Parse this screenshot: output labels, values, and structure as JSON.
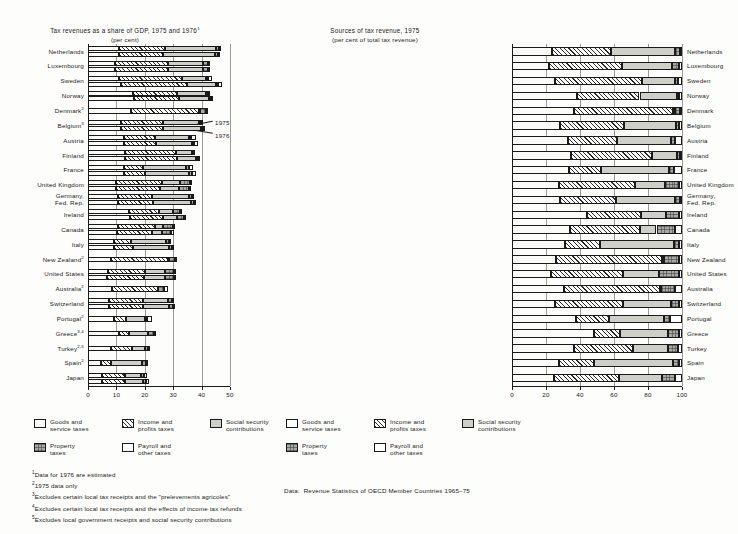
{
  "left": {
    "title": "Tax revenues as a share of GDP, 1975 and 1976",
    "title_sup": "1",
    "subtitle": "(per cent)",
    "annotation_1975": "1975",
    "annotation_1976": "1976"
  },
  "right": {
    "title": "Sources of tax revenue, 1975",
    "subtitle": "(per cent of total tax revenue)"
  },
  "legend": {
    "items": [
      {
        "key": "goods",
        "line1": "Goods and",
        "line2": "service taxes"
      },
      {
        "key": "income",
        "line1": "Income and",
        "line2": "profits taxes"
      },
      {
        "key": "social",
        "line1": "Social security",
        "line2": "contributions"
      },
      {
        "key": "property",
        "line1": "Property",
        "line2": "taxes"
      },
      {
        "key": "payroll",
        "line1": "Payroll and",
        "line2": "other taxes"
      }
    ]
  },
  "footnotes": [
    {
      "mark": "1",
      "text": "Data for 1976 are estimated"
    },
    {
      "mark": "2",
      "text": "1975 data only"
    },
    {
      "mark": "3",
      "text": "Excludes certain local tax receipts and the \"prelevements agricoles\""
    },
    {
      "mark": "4",
      "text": "Excludes certain local tax receipts and the effects of income tax refunds"
    },
    {
      "mark": "5",
      "text": "Excludes local government receipts and social security contributions"
    }
  ],
  "source": {
    "label": "Data:",
    "text": "Revenue Statistics of OECD Member Countries 1965–75"
  },
  "chart_data": [
    {
      "type": "bar",
      "id": "tax-share-of-gdp",
      "orientation": "horizontal",
      "stacked": true,
      "title": "Tax revenues as a share of GDP, 1975 and 1976",
      "subtitle": "(per cent)",
      "xlabel": "",
      "ylabel": "",
      "xlim": [
        0,
        50
      ],
      "xticks": [
        0,
        10,
        20,
        30,
        40,
        50
      ],
      "grid": true,
      "legend_position": "bottom",
      "series": [
        {
          "name": "Goods and service taxes",
          "key": "goods"
        },
        {
          "name": "Income and profits taxes",
          "key": "income"
        },
        {
          "name": "Social security contributions",
          "key": "social"
        },
        {
          "name": "Property taxes",
          "key": "property"
        },
        {
          "name": "Payroll and other taxes",
          "key": "payroll"
        }
      ],
      "categories": [
        "Netherlands",
        "Luxembourg",
        "Sweden",
        "Norway",
        "Denmark",
        "Belgium",
        "Austria",
        "Finland",
        "France",
        "United Kingdom",
        "Germany, Fed. Rep.",
        "Ireland",
        "Canada",
        "Italy",
        "New Zealand",
        "United States",
        "Australia",
        "Switzerland",
        "Portugal",
        "Greece",
        "Turkey",
        "Spain",
        "Japan"
      ],
      "rows": [
        {
          "country": "Netherlands",
          "footnote": "",
          "y1975": {
            "goods": 11.0,
            "income": 16.0,
            "social": 18.0,
            "property": 1.2,
            "payroll": 0.6
          },
          "y1976": {
            "goods": 11.0,
            "income": 15.5,
            "social": 18.2,
            "property": 1.2,
            "payroll": 0.6
          }
        },
        {
          "country": "Luxembourg",
          "footnote": "",
          "y1975": {
            "goods": 9.5,
            "income": 18.5,
            "social": 12.5,
            "property": 1.8,
            "payroll": 0.5
          },
          "y1976": {
            "goods": 9.5,
            "income": 18.5,
            "social": 12.5,
            "property": 1.8,
            "payroll": 0.5
          }
        },
        {
          "country": "Sweden",
          "footnote": "",
          "y1975": {
            "goods": 11.0,
            "income": 22.0,
            "social": 8.5,
            "property": 0.6,
            "payroll": 1.4
          },
          "y1976": {
            "goods": 11.5,
            "income": 23.5,
            "social": 10.0,
            "property": 0.6,
            "payroll": 1.6
          }
        },
        {
          "country": "Norway",
          "footnote": "",
          "y1975": {
            "goods": 16.0,
            "income": 15.5,
            "social": 10.0,
            "property": 0.6,
            "payroll": 0.5
          },
          "y1976": {
            "goods": 16.2,
            "income": 16.0,
            "social": 10.5,
            "property": 0.6,
            "payroll": 0.5
          }
        },
        {
          "country": "Denmark",
          "footnote": "2",
          "y1975": {
            "goods": 15.0,
            "income": 24.0,
            "social": 0.6,
            "property": 1.9,
            "payroll": 0.5
          }
        },
        {
          "country": "Belgium",
          "footnote": "3",
          "y1975": {
            "goods": 11.5,
            "income": 15.0,
            "social": 12.5,
            "property": 0.8,
            "payroll": 0.5
          },
          "y1976": {
            "goods": 11.5,
            "income": 15.0,
            "social": 13.2,
            "property": 0.8,
            "payroll": 0.5
          }
        },
        {
          "country": "Austria",
          "footnote": "",
          "y1975": {
            "goods": 12.5,
            "income": 11.0,
            "social": 12.0,
            "property": 0.8,
            "payroll": 1.6
          },
          "y1976": {
            "goods": 12.5,
            "income": 11.5,
            "social": 12.5,
            "property": 0.8,
            "payroll": 1.6
          }
        },
        {
          "country": "Finland",
          "footnote": "",
          "y1975": {
            "goods": 13.0,
            "income": 18.0,
            "social": 5.5,
            "property": 0.6,
            "payroll": 0.6
          },
          "y1976": {
            "goods": 13.0,
            "income": 18.5,
            "social": 6.5,
            "property": 0.6,
            "payroll": 0.6
          }
        },
        {
          "country": "France",
          "footnote": "",
          "y1975": {
            "goods": 12.5,
            "income": 7.0,
            "social": 15.0,
            "property": 1.0,
            "payroll": 1.6
          },
          "y1976": {
            "goods": 12.5,
            "income": 7.5,
            "social": 15.5,
            "property": 1.0,
            "payroll": 1.6
          }
        },
        {
          "country": "United Kingdom",
          "footnote": "",
          "y1975": {
            "goods": 10.0,
            "income": 16.0,
            "social": 6.5,
            "property": 3.5,
            "payroll": 0.6
          },
          "y1976": {
            "goods": 10.0,
            "income": 15.5,
            "social": 6.5,
            "property": 3.5,
            "payroll": 0.6
          }
        },
        {
          "country": "Germany, Fed. Rep.",
          "footnote": "",
          "y1975": {
            "goods": 10.5,
            "income": 12.0,
            "social": 13.0,
            "property": 1.2,
            "payroll": 0.5
          },
          "y1976": {
            "goods": 10.5,
            "income": 12.5,
            "social": 13.2,
            "property": 1.2,
            "payroll": 0.5
          }
        },
        {
          "country": "Ireland",
          "footnote": "",
          "y1975": {
            "goods": 14.5,
            "income": 10.5,
            "social": 5.0,
            "property": 2.3,
            "payroll": 0.6
          },
          "y1976": {
            "goods": 14.8,
            "income": 11.5,
            "social": 5.2,
            "property": 2.3,
            "payroll": 0.6
          }
        },
        {
          "country": "Canada",
          "footnote": "",
          "y1975": {
            "goods": 10.5,
            "income": 13.0,
            "social": 3.0,
            "property": 3.3,
            "payroll": 1.0
          },
          "y1976": {
            "goods": 10.2,
            "income": 12.5,
            "social": 3.2,
            "property": 3.3,
            "payroll": 1.0
          }
        },
        {
          "country": "Italy",
          "footnote": "",
          "y1975": {
            "goods": 9.0,
            "income": 6.0,
            "social": 12.5,
            "property": 1.0,
            "payroll": 0.5
          },
          "y1976": {
            "goods": 9.2,
            "income": 6.5,
            "social": 12.8,
            "property": 1.0,
            "payroll": 0.5
          }
        },
        {
          "country": "New Zealand",
          "footnote": "2",
          "y1975": {
            "goods": 8.0,
            "income": 20.0,
            "social": 0.4,
            "property": 2.4,
            "payroll": 0.5
          }
        },
        {
          "country": "United States",
          "footnote": "",
          "y1975": {
            "goods": 7.0,
            "income": 13.0,
            "social": 7.0,
            "property": 3.4,
            "payroll": 0.5
          },
          "y1976": {
            "goods": 6.8,
            "income": 13.0,
            "social": 7.2,
            "property": 3.4,
            "payroll": 0.5
          }
        },
        {
          "country": "Australia",
          "footnote": "2",
          "y1975": {
            "goods": 8.5,
            "income": 16.0,
            "social": 0.2,
            "property": 2.2,
            "payroll": 1.4
          }
        },
        {
          "country": "Switzerland",
          "footnote": "",
          "y1975": {
            "goods": 7.5,
            "income": 12.0,
            "social": 8.5,
            "property": 1.5,
            "payroll": 0.5
          },
          "y1976": {
            "goods": 7.5,
            "income": 12.0,
            "social": 9.0,
            "property": 1.5,
            "payroll": 0.5
          }
        },
        {
          "country": "Portugal",
          "footnote": "2",
          "y1975": {
            "goods": 9.0,
            "income": 4.5,
            "social": 6.5,
            "property": 0.8,
            "payroll": 1.8
          }
        },
        {
          "country": "Greece",
          "footnote": "3,4",
          "y1975": {
            "goods": 11.0,
            "income": 3.5,
            "social": 6.5,
            "property": 2.2,
            "payroll": 0.5
          }
        },
        {
          "country": "Turkey",
          "footnote": "2,5",
          "y1975": {
            "goods": 8.0,
            "income": 7.5,
            "social": 4.5,
            "property": 1.2,
            "payroll": 0.5
          }
        },
        {
          "country": "Spain",
          "footnote": "2",
          "y1975": {
            "goods": 4.5,
            "income": 3.5,
            "social": 11.0,
            "property": 1.3,
            "payroll": 0.4
          }
        },
        {
          "country": "Japan",
          "footnote": "",
          "y1975": {
            "goods": 5.0,
            "income": 8.0,
            "social": 5.5,
            "property": 1.3,
            "payroll": 1.0
          },
          "y1976": {
            "goods": 5.0,
            "income": 8.2,
            "social": 6.0,
            "property": 1.3,
            "payroll": 1.0
          }
        }
      ]
    },
    {
      "type": "bar",
      "id": "sources-of-tax-revenue",
      "orientation": "horizontal",
      "stacked": true,
      "normalized": true,
      "title": "Sources of tax revenue, 1975",
      "subtitle": "(per cent of total tax revenue)",
      "xlabel": "",
      "ylabel": "",
      "xlim": [
        0,
        100
      ],
      "xticks": [
        0,
        20,
        40,
        60,
        80,
        100
      ],
      "grid": true,
      "legend_position": "bottom",
      "series": [
        {
          "name": "Goods and service taxes",
          "key": "goods"
        },
        {
          "name": "Income and profits taxes",
          "key": "income"
        },
        {
          "name": "Social security contributions",
          "key": "social"
        },
        {
          "name": "Property taxes",
          "key": "property"
        },
        {
          "name": "Payroll and other taxes",
          "key": "payroll"
        }
      ],
      "rows": [
        {
          "country": "Netherlands",
          "goods": 23.5,
          "income": 35.0,
          "social": 37.5,
          "property": 2.6,
          "payroll": 1.4
        },
        {
          "country": "Luxembourg",
          "goods": 22.0,
          "income": 42.5,
          "social": 29.5,
          "property": 4.2,
          "payroll": 1.8
        },
        {
          "country": "Sweden",
          "goods": 25.5,
          "income": 51.0,
          "social": 19.5,
          "property": 1.4,
          "payroll": 2.6
        },
        {
          "country": "Norway",
          "goods": 38.0,
          "income": 37.0,
          "social": 22.0,
          "property": 1.5,
          "payroll": 1.5
        },
        {
          "country": "Denmark",
          "goods": 36.5,
          "income": 58.0,
          "social": 1.5,
          "property": 3.0,
          "payroll": 1.0
        },
        {
          "country": "Belgium",
          "goods": 28.5,
          "income": 37.5,
          "social": 30.5,
          "property": 2.0,
          "payroll": 1.5
        },
        {
          "country": "Austria",
          "goods": 33.0,
          "income": 29.0,
          "social": 31.5,
          "property": 2.3,
          "payroll": 4.2
        },
        {
          "country": "Finland",
          "goods": 34.5,
          "income": 48.0,
          "social": 14.5,
          "property": 1.6,
          "payroll": 1.4
        },
        {
          "country": "France",
          "goods": 33.5,
          "income": 19.0,
          "social": 40.0,
          "property": 2.7,
          "payroll": 4.8
        },
        {
          "country": "United Kingdom",
          "goods": 27.5,
          "income": 45.0,
          "social": 17.5,
          "property": 8.5,
          "payroll": 1.5
        },
        {
          "country": "Germany, Fed. Rep.",
          "goods": 28.5,
          "income": 32.5,
          "social": 35.0,
          "property": 3.0,
          "payroll": 1.0
        },
        {
          "country": "Ireland",
          "goods": 44.0,
          "income": 32.0,
          "social": 14.5,
          "property": 7.5,
          "payroll": 2.0
        },
        {
          "country": "Canada",
          "goods": 34.0,
          "income": 41.5,
          "social": 9.5,
          "property": 11.0,
          "payroll": 4.0
        },
        {
          "country": "Italy",
          "goods": 31.0,
          "income": 20.5,
          "social": 44.0,
          "property": 3.0,
          "payroll": 1.5
        },
        {
          "country": "New Zealand",
          "goods": 26.0,
          "income": 62.0,
          "social": 1.3,
          "property": 8.7,
          "payroll": 2.0
        },
        {
          "country": "United States",
          "goods": 23.0,
          "income": 42.5,
          "social": 21.0,
          "property": 11.5,
          "payroll": 2.0
        },
        {
          "country": "Australia",
          "goods": 30.5,
          "income": 56.5,
          "social": 0.7,
          "property": 8.3,
          "payroll": 4.0
        },
        {
          "country": "Switzerland",
          "goods": 25.0,
          "income": 40.0,
          "social": 28.5,
          "property": 5.0,
          "payroll": 1.5
        },
        {
          "country": "Portugal",
          "goods": 37.5,
          "income": 19.5,
          "social": 32.5,
          "property": 3.5,
          "payroll": 7.0
        },
        {
          "country": "Greece",
          "goods": 48.0,
          "income": 15.5,
          "social": 28.5,
          "property": 6.5,
          "payroll": 1.5
        },
        {
          "country": "Turkey",
          "goods": 36.5,
          "income": 34.5,
          "social": 21.0,
          "property": 5.5,
          "payroll": 2.5
        },
        {
          "country": "Spain",
          "goods": 27.5,
          "income": 21.0,
          "social": 46.0,
          "property": 4.0,
          "payroll": 1.5
        },
        {
          "country": "Japan",
          "goods": 24.5,
          "income": 38.5,
          "social": 25.0,
          "property": 8.0,
          "payroll": 4.0
        }
      ]
    }
  ]
}
